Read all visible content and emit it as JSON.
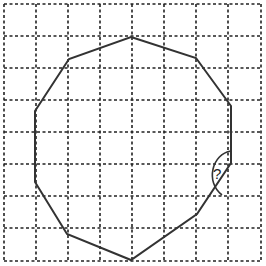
{
  "diagram": {
    "type": "decagon-on-grid",
    "grid": {
      "columns": 8,
      "rows": 8,
      "line_style": "dashed",
      "color": "#222222"
    },
    "polygon": {
      "name": "decagon",
      "sides": 10,
      "stroke": "#333333"
    },
    "angle_marker": {
      "label": "?"
    }
  }
}
